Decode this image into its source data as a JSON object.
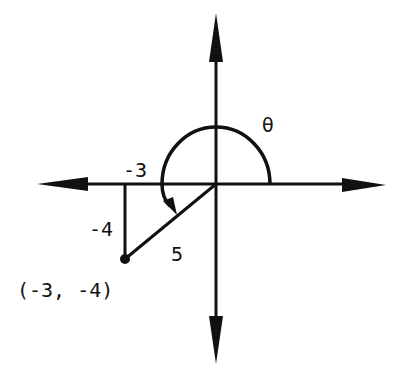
{
  "diagram": {
    "type": "coordinate-plane-reference-angle",
    "origin": {
      "x": 0,
      "y": 0
    },
    "point": {
      "x": -3,
      "y": -4,
      "label": "(-3, -4)"
    },
    "labels": {
      "horizontal_leg": "-3",
      "vertical_leg": "-4",
      "hypotenuse": "5",
      "angle": "θ"
    },
    "angle_description": "Angle θ drawn counterclockwise from the positive x-axis to the terminal side through (-3, -4)",
    "colors": {
      "ink": "#111111",
      "background": "#ffffff"
    }
  }
}
